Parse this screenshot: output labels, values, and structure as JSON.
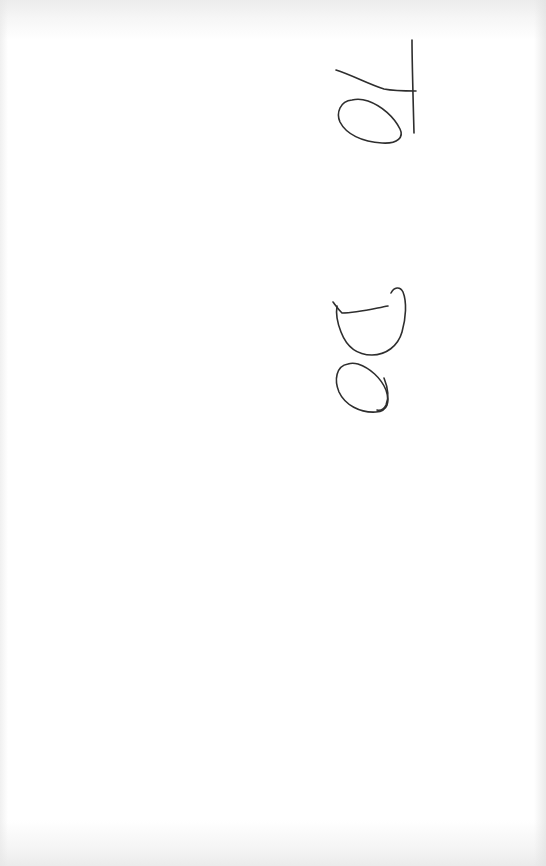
{
  "document": {
    "type": "scanned handwritten note",
    "orientation": "rotated 90 degrees",
    "handwritten_text": "TO DO",
    "words": [
      {
        "text": "TO",
        "letters": [
          "T",
          "O"
        ]
      },
      {
        "text": "DO",
        "letters": [
          "D",
          "O"
        ]
      }
    ],
    "colors": {
      "paper": "#ffffff",
      "ink": "#2e2e2e"
    }
  }
}
